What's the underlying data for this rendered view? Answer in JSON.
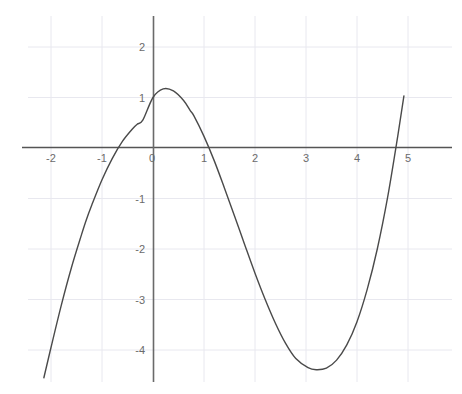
{
  "chart_data": {
    "type": "line",
    "title": "",
    "subtitle": "",
    "xlabel": "",
    "ylabel": "",
    "xlim": [
      -2.4,
      5.6
    ],
    "ylim": [
      -4.65,
      2.65
    ],
    "grid": true,
    "legend": null,
    "legend_position": "none",
    "x_ticks": [
      -2,
      -1,
      0,
      1,
      2,
      3,
      4,
      5
    ],
    "x_tick_labels": [
      "-2",
      "-1",
      "0",
      "1",
      "2",
      "3",
      "4",
      "5"
    ],
    "y_ticks": [
      -4,
      -3,
      -2,
      -1,
      1,
      2
    ],
    "y_tick_labels": [
      "-4",
      "-3",
      "-2",
      "-1",
      "1",
      "2"
    ],
    "series": [
      {
        "name": "cubic",
        "color": "#4a4a4a",
        "line_width": 1.4,
        "expression": "y = 0.227x^3 - 0.91x^2 - 0.66x + 1",
        "x": [
          -2.14,
          -2.0,
          -1.8,
          -1.6,
          -1.4,
          -1.31,
          -1.2,
          -1.0,
          -0.8,
          -0.6,
          -0.4,
          -0.31,
          -0.2,
          0.0,
          0.2,
          0.4,
          0.6,
          0.73,
          0.8,
          1.0,
          1.2,
          1.4,
          1.6,
          1.8,
          2.0,
          2.2,
          2.4,
          2.6,
          2.8,
          3.04,
          3.2,
          3.4,
          3.6,
          3.8,
          4.0,
          4.2,
          4.4,
          4.6,
          4.8,
          4.92
        ],
        "y": [
          -4.55,
          -3.95,
          -3.12,
          -2.37,
          -1.71,
          -1.43,
          -1.13,
          -0.63,
          -0.21,
          0.13,
          0.38,
          0.47,
          0.55,
          1.0,
          1.17,
          1.13,
          0.94,
          0.74,
          0.64,
          0.23,
          -0.25,
          -0.79,
          -1.35,
          -1.92,
          -2.48,
          -3.0,
          -3.47,
          -3.87,
          -4.17,
          -4.35,
          -4.39,
          -4.36,
          -4.2,
          -3.9,
          -3.44,
          -2.8,
          -1.99,
          -0.98,
          0.24,
          1.03
        ],
        "local_maximum": {
          "x": -0.31,
          "y": 1.21
        },
        "local_minimum": {
          "x": 3.04,
          "y": -4.35
        },
        "y_intercept": 1.0,
        "x_intercepts": [
          -1.31,
          0.73,
          4.6
        ]
      }
    ],
    "colors": {
      "curve": "#4a4a4a",
      "axis": "#555555",
      "grid": "#e8e8ef",
      "tick_label": "#6b6b6b",
      "background": "#ffffff"
    }
  },
  "figure": {
    "axis_origin_px": {
      "x": 153,
      "y": 148
    },
    "scale_px_per_unit": {
      "x": 51,
      "y": 50.5
    }
  }
}
